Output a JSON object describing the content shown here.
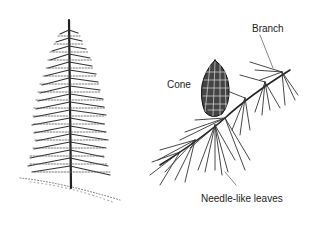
{
  "figure": {
    "labels": {
      "branch": "Branch",
      "cone": "Cone",
      "needles": "Needle-like leaves"
    },
    "colors": {
      "ink": "#222222",
      "background": "#ffffff"
    }
  }
}
